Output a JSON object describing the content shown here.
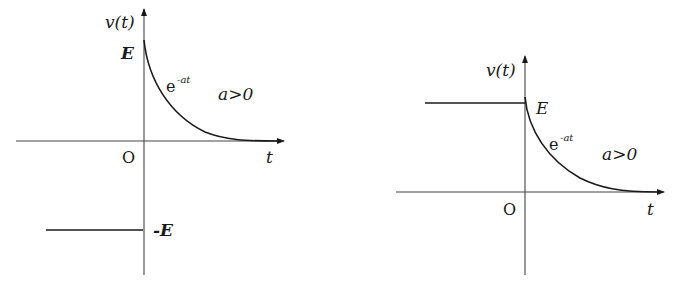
{
  "figures": [
    {
      "id": "left",
      "y_label": "v(t)",
      "x_label": "t",
      "origin_label": "O",
      "level_before_zero": "-E",
      "start_value_label": "E",
      "curve_label_base": "e",
      "curve_label_exp": "-at",
      "condition_label": "a>0"
    },
    {
      "id": "right",
      "y_label": "v(t)",
      "x_label": "t",
      "origin_label": "O",
      "start_value_label": "E",
      "curve_label_base": "e",
      "curve_label_exp": "-at",
      "condition_label": "a>0"
    }
  ],
  "colors": {
    "stroke": "#1a1a1a",
    "axis": "#444444"
  }
}
